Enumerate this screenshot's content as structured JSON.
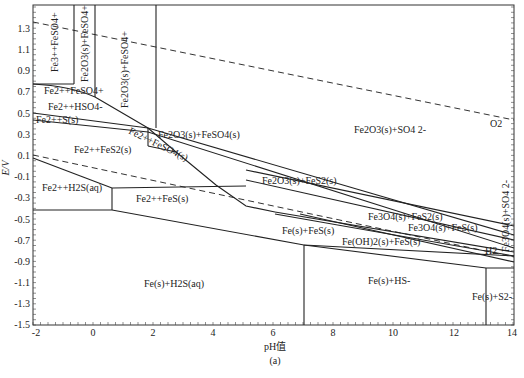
{
  "chart_data": {
    "type": "diagram",
    "title": "",
    "subtitle": "",
    "caption": "(a)",
    "xlabel": "pH值",
    "ylabel": "E/V",
    "xlim": [
      -2,
      14
    ],
    "ylim": [
      -1.5,
      1.52
    ],
    "xticks": [
      "-2",
      "0",
      "2",
      "4",
      "6",
      "8",
      "10",
      "12",
      "14"
    ],
    "yticks": [
      "1.3",
      "1.1",
      "0.9",
      "0.7",
      "0.5",
      "0.3",
      "0.1",
      "-0.1",
      "-0.3",
      "-0.5",
      "-0.7",
      "-0.9",
      "-1.1",
      "-1.3",
      "-1.5"
    ],
    "grid": false,
    "legend": null,
    "regions": [
      {
        "label": "Fe3++FeSO4+",
        "ph": -1.3,
        "E": 1.05,
        "rotated": true
      },
      {
        "label": "Fe2O3(s)+FeSO4+",
        "ph": 0.0,
        "E": 1.25,
        "rotated": true
      },
      {
        "label": "Fe2O3(s)+FeSO4+",
        "ph": 1.5,
        "E": 0.95,
        "rotated": true
      },
      {
        "label": "Fe2++FeSO4+",
        "ph": -0.4,
        "E": 0.72
      },
      {
        "label": "Fe2++HSO4-",
        "ph": -0.7,
        "E": 0.57
      },
      {
        "label": "Fe2++S(s)",
        "ph": -1.5,
        "E": 0.43
      },
      {
        "label": "Fe2++FeS2(s)",
        "ph": 0.0,
        "E": 0.2
      },
      {
        "label": "Fe2++FeSO4(s)",
        "ph": 2.6,
        "E": 0.25,
        "rotated": true
      },
      {
        "label": "Fe2O3(s)+FeSO4(s)",
        "ph": 4.2,
        "E": 0.3
      },
      {
        "label": "Fe2O3(s)+SO4 2-",
        "ph": 10.5,
        "E": 0.37
      },
      {
        "label": "Fe2O3(s)+FeS2(s)",
        "ph": 7.5,
        "E": -0.1
      },
      {
        "label": "Fe2++H2S(aq)",
        "ph": -0.8,
        "E": -0.22
      },
      {
        "label": "Fe2++FeS(s)",
        "ph": 1.9,
        "E": -0.33
      },
      {
        "label": "Fe3O4(s)+FeS2(s)",
        "ph": 10.2,
        "E": -0.4
      },
      {
        "label": "Fe3O4(s)+FeS(s)",
        "ph": 11.6,
        "E": -0.46
      },
      {
        "label": "Fe(s)+FeS(s)",
        "ph": 7.2,
        "E": -0.5
      },
      {
        "label": "Fe(OH)2(s)+FeS(s)",
        "ph": 9.8,
        "E": -0.56
      },
      {
        "label": "Fe3O4(s)+SO4 2-",
        "ph": 13.6,
        "E": -0.4,
        "rotated": true
      },
      {
        "label": "Fe(s)+H2S(aq)",
        "ph": 3.3,
        "E": -0.88
      },
      {
        "label": "Fe(s)+HS-",
        "ph": 10.2,
        "E": -1.04
      },
      {
        "label": "Fe(s)+S2-",
        "ph": 13.3,
        "E": -1.2
      }
    ],
    "reference_lines": [
      {
        "name": "O2",
        "style": "dashed",
        "points": [
          [
            -2,
            1.35
          ],
          [
            14,
            0.38
          ]
        ]
      },
      {
        "name": "H2",
        "style": "dashed",
        "points": [
          [
            -2,
            0.12
          ],
          [
            14,
            -0.83
          ]
        ]
      }
    ]
  }
}
